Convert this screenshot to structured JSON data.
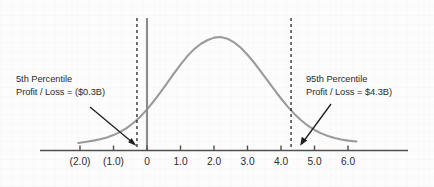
{
  "chart_data": {
    "type": "line",
    "title": "",
    "subtitle": "",
    "xlabel": "",
    "ylabel": "",
    "xlim": [
      -2.45,
      6.55
    ],
    "ylim": [
      0,
      1.08
    ],
    "grid": false,
    "legend": null,
    "x_tick_labels": [
      "(2.0)",
      "(1.0)",
      "0",
      "1.0",
      "2.0",
      "3.0",
      "4.0",
      "5.0",
      "6.0"
    ],
    "x_tick_values": [
      -2.0,
      -1.0,
      0.0,
      1.0,
      2.0,
      3.0,
      4.0,
      5.0,
      6.0
    ],
    "series": [
      {
        "name": "Profit / Loss distribution",
        "type": "line",
        "color": "#9b9b9b",
        "peak_x": 2.0,
        "peak_y": 1.0,
        "x": [
          -2.05,
          -1.8,
          -1.6,
          -1.4,
          -1.2,
          -1.0,
          -0.8,
          -0.6,
          -0.4,
          -0.2,
          0.0,
          0.2,
          0.4,
          0.6,
          0.8,
          1.0,
          1.2,
          1.4,
          1.6,
          1.8,
          2.0,
          2.2,
          2.4,
          2.6,
          2.8,
          3.0,
          3.2,
          3.4,
          3.6,
          3.8,
          4.0,
          4.2,
          4.4,
          4.6,
          4.8,
          5.0,
          5.2,
          5.4,
          5.6,
          5.8,
          6.0,
          6.25
        ],
        "y": [
          0.0,
          0.012,
          0.022,
          0.035,
          0.052,
          0.074,
          0.104,
          0.142,
          0.189,
          0.246,
          0.314,
          0.39,
          0.473,
          0.56,
          0.648,
          0.733,
          0.81,
          0.875,
          0.925,
          0.96,
          0.985,
          0.99,
          0.975,
          0.94,
          0.89,
          0.825,
          0.75,
          0.668,
          0.583,
          0.498,
          0.416,
          0.34,
          0.272,
          0.213,
          0.163,
          0.122,
          0.09,
          0.065,
          0.046,
          0.032,
          0.022,
          0.014
        ]
      }
    ],
    "vertical_reference_lines": [
      {
        "name": "5th-percentile-line",
        "x": -0.3,
        "style": "dashed",
        "color": "#1f1f1f"
      },
      {
        "name": "95th-percentile-line",
        "x": 4.3,
        "style": "dashed",
        "color": "#1f1f1f"
      },
      {
        "name": "zero-axis-line",
        "x": 0.0,
        "style": "solid",
        "color": "#8c8c8c"
      }
    ],
    "annotations": [
      {
        "name": "5th-percentile-annotation",
        "title": "5th Percentile",
        "value_line": "Profit / Loss = ($0.3B)",
        "percentile": "5th",
        "value": "($0.3B)",
        "points_to_x": -0.3
      },
      {
        "name": "95th-percentile-annotation",
        "title": "95th Percentile",
        "value_line": "Profit / Loss = $4.3B)",
        "percentile": "95th",
        "value": "$4.3B",
        "points_to_x": 4.3
      }
    ],
    "colors": {
      "curve": "#9b9b9b",
      "axis": "#4f4f4f",
      "dashed": "#1f1f1f",
      "zero_line": "#8c8c8c",
      "text": "#2b2b2b",
      "background": "#fcfcfc"
    }
  }
}
